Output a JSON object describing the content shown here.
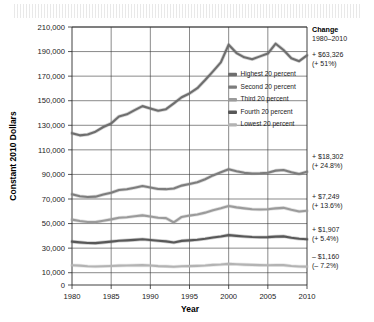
{
  "chart_data": {
    "type": "line",
    "title": "",
    "xlabel": "Year",
    "ylabel": "Constant 2010 Dollars",
    "xlim": [
      1980,
      2010
    ],
    "ylim": [
      0,
      210000
    ],
    "grid": true,
    "legend_position": "inside-right",
    "x_ticks": [
      "1980",
      "1985",
      "1990",
      "1995",
      "2000",
      "2005",
      "2010"
    ],
    "y_ticks": [
      "0",
      "10,000",
      "30,000",
      "50,000",
      "70,000",
      "90,000",
      "110,000",
      "130,000",
      "150,000",
      "170,000",
      "190,000",
      "210,000"
    ],
    "x": [
      1980,
      1981,
      1982,
      1983,
      1984,
      1985,
      1986,
      1987,
      1988,
      1989,
      1990,
      1991,
      1992,
      1993,
      1994,
      1995,
      1996,
      1997,
      1998,
      1999,
      2000,
      2001,
      2002,
      2003,
      2004,
      2005,
      2006,
      2007,
      2008,
      2009,
      2010
    ],
    "series": [
      {
        "name": "Highest 20 percent",
        "color": "#6e6e6e",
        "values": [
          123600,
          121800,
          122500,
          124800,
          128600,
          131500,
          137200,
          138900,
          142300,
          145600,
          143700,
          141900,
          143100,
          147800,
          152800,
          155900,
          160200,
          166800,
          173900,
          181200,
          195600,
          188800,
          185300,
          183800,
          186100,
          188400,
          196400,
          191300,
          184600,
          182200,
          186926
        ]
      },
      {
        "name": "Second 20 percent",
        "color": "#7d7d7d",
        "values": [
          73800,
          72200,
          71600,
          71900,
          73600,
          75100,
          77300,
          77900,
          79200,
          80600,
          79400,
          78100,
          78000,
          78600,
          80900,
          82200,
          83600,
          86100,
          89200,
          91700,
          94200,
          92600,
          91300,
          90700,
          90900,
          91400,
          93100,
          93600,
          91800,
          90300,
          92102
        ]
      },
      {
        "name": "Third 20 percent",
        "color": "#9b9b9b",
        "values": [
          53200,
          52100,
          51300,
          51200,
          52300,
          53400,
          54700,
          55200,
          55900,
          56700,
          55800,
          54800,
          54400,
          50900,
          55400,
          56500,
          57400,
          58900,
          60900,
          62500,
          64300,
          63200,
          62400,
          61700,
          61400,
          61600,
          62400,
          62800,
          61200,
          59800,
          60449
        ]
      },
      {
        "name": "Fourth 20 percent",
        "color": "#585858",
        "values": [
          35300,
          34700,
          34200,
          34100,
          34700,
          35300,
          36000,
          36300,
          36700,
          37200,
          36600,
          36000,
          35500,
          34600,
          35900,
          36300,
          36800,
          37600,
          38700,
          39500,
          40600,
          40000,
          39500,
          39100,
          38900,
          39000,
          39400,
          39600,
          38500,
          37600,
          37222
        ]
      },
      {
        "name": "Lowest 20 percent",
        "color": "#b3b3b3",
        "values": [
          16100,
          15800,
          15300,
          15100,
          15300,
          15500,
          15800,
          15900,
          16000,
          16200,
          15900,
          15400,
          15200,
          14900,
          15200,
          15400,
          15600,
          15900,
          16400,
          16700,
          17200,
          16900,
          16600,
          16400,
          16200,
          16100,
          16200,
          16200,
          15500,
          15000,
          14940
        ]
      }
    ],
    "annotations": [
      {
        "id": "change-header",
        "line1": "Change",
        "line2": "1980–2010"
      },
      {
        "id": "highest-change",
        "amount": "+ $63,326",
        "percent": "(+ 51%)"
      },
      {
        "id": "second-change",
        "amount": "+ $18,302",
        "percent": "(+ 24.8%)"
      },
      {
        "id": "third-change",
        "amount": "+ $7,249",
        "percent": "(+ 13.6%)"
      },
      {
        "id": "fourth-change",
        "amount": "+ $1,907",
        "percent": "(+ 5.4%)"
      },
      {
        "id": "lowest-change",
        "amount": "– $1,160",
        "percent": "(– 7.2%)"
      }
    ]
  },
  "legend": {
    "items": [
      {
        "label": "Highest 20 percent",
        "color": "#6e6e6e"
      },
      {
        "label": "Second 20 percent",
        "color": "#7d7d7d"
      },
      {
        "label": "Third 20 percent",
        "color": "#9b9b9b"
      },
      {
        "label": "Fourth 20 percent",
        "color": "#585858"
      },
      {
        "label": "Lowest 20 percent",
        "color": "#b3b3b3"
      }
    ]
  }
}
